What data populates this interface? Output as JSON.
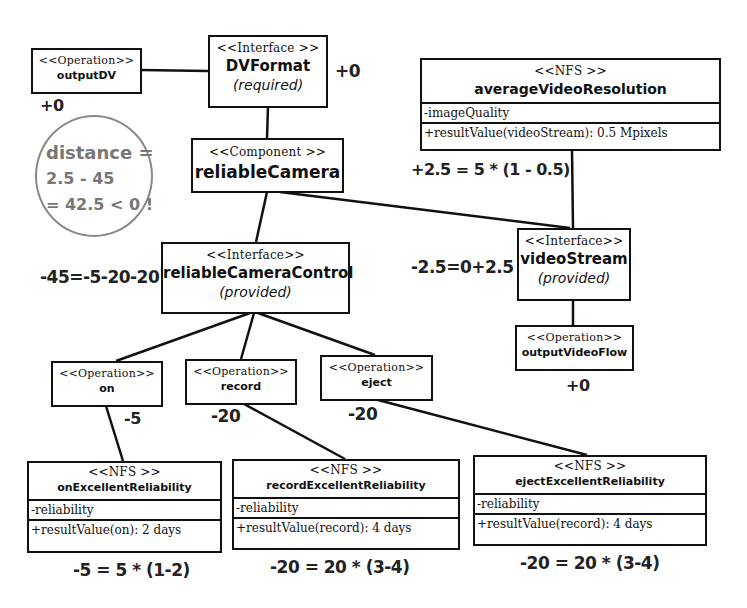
{
  "nodes": {
    "outputDV": {
      "stereotype": "<<Operation>>",
      "name": "outputDV"
    },
    "dvFormat": {
      "stereotype": "<<Interface >>",
      "name": "DVFormat",
      "qualifier": "(required)"
    },
    "reliableCamera": {
      "stereotype": "<<Component >>",
      "name": "reliableCamera"
    },
    "averageVideoResolution": {
      "stereotype": "<<NFS >>",
      "name": "averageVideoResolution",
      "attribute": "-imageQuality",
      "operation": "+resultValue(videoStream): 0.5 Mpixels"
    },
    "reliableCameraControl": {
      "stereotype": "<<Interface>>",
      "name": "reliableCameraControl",
      "qualifier": "(provided)"
    },
    "videoStream": {
      "stereotype": "<<Interface>>",
      "name": "videoStream",
      "qualifier": "(provided)"
    },
    "outputVideoFlow": {
      "stereotype": "<<Operation>>",
      "name": "outputVideoFlow"
    },
    "on": {
      "stereotype": "<<Operation>>",
      "name": "on"
    },
    "record": {
      "stereotype": "<<Operation>>",
      "name": "record"
    },
    "eject": {
      "stereotype": "<<Operation>>",
      "name": "eject"
    },
    "onExcellentReliability": {
      "stereotype": "<<NFS >>",
      "name": "onExcellentReliability",
      "attribute": "-reliability",
      "operation": "+resultValue(on): 2 days"
    },
    "recordExcellentReliability": {
      "stereotype": "<<NFS >>",
      "name": "recordExcellentReliability",
      "attribute": "-reliability",
      "operation": "+resultValue(record): 4 days"
    },
    "ejectExcellentReliability": {
      "stereotype": "<<NFS >>",
      "name": "ejectExcellentReliability",
      "attribute": "-reliability",
      "operation": "+resultValue(record): 4 days"
    }
  },
  "scores": {
    "dvFormat": "+0",
    "outputDV": "+0",
    "averageVideoResolution": "+2.5 = 5 * (1 - 0.5)",
    "reliableCameraControl": "-45=-5-20-20",
    "videoStream": "-2.5=0+2.5",
    "outputVideoFlow": "+0",
    "on": "-5",
    "record": "-20",
    "eject": "-20",
    "onExcellentReliability": "-5 = 5 * (1-2)",
    "recordExcellentReliability": "-20 = 20 * (3-4)",
    "ejectExcellentReliability": "-20 = 20 * (3-4)"
  },
  "distance_note": {
    "line1": "distance =",
    "line2": "2.5 - 45",
    "line3": "= 42.5 < 0 !"
  },
  "colors": {
    "line": "#111111",
    "note": "#888888"
  }
}
